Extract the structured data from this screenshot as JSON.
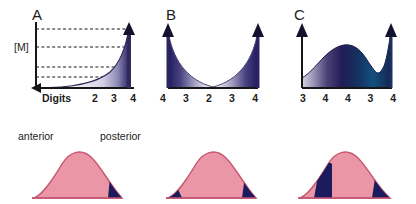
{
  "figure": {
    "panels": [
      {
        "letter": "A",
        "y_axis_label": "[M]",
        "x_axis_prefix": "Digits",
        "ticks": [
          "2",
          "3",
          "4"
        ],
        "curve_shape": "exponential-rise",
        "dashed_guides": 4,
        "arrow_x_direction": "left",
        "arrow_peak": "up",
        "fill_start": "#ffffff",
        "fill_end": "#2b2560"
      },
      {
        "letter": "B",
        "y_axis_label": "",
        "x_axis_prefix": "",
        "ticks": [
          "4",
          "3",
          "2",
          "3",
          "4"
        ],
        "curve_shape": "u-shaped-valley",
        "dashed_guides": 0,
        "arrow_x_direction": "none",
        "arrow_peak": "up-both",
        "fill_start": "#ffffff",
        "fill_end": "#201a5c"
      },
      {
        "letter": "C",
        "y_axis_label": "",
        "x_axis_prefix": "",
        "ticks": [
          "3",
          "4",
          "4",
          "3",
          "4"
        ],
        "curve_shape": "dome-dip-rise",
        "dashed_guides": 0,
        "arrow_x_direction": "none",
        "arrow_peak": "up-both",
        "fill_start": "#d8d4e2",
        "fill_end": "#10255e"
      }
    ],
    "limb_buds": [
      {
        "anterior_label": "anterior",
        "posterior_label": "posterior",
        "domain_pattern": "posterior-wedge-only"
      },
      {
        "anterior_label": "",
        "posterior_label": "",
        "domain_pattern": "both-edge-wedges"
      },
      {
        "anterior_label": "",
        "posterior_label": "",
        "domain_pattern": "wide-left-band-and-right-wedge"
      }
    ],
    "colors": {
      "tissue_pink": "#eb96a6",
      "tissue_outline": "#c4566f",
      "domain_navy": "#1b1b5e",
      "axis_black": "#161616",
      "gradient_dark": "#231d5e",
      "gradient_teal": "#12416e"
    }
  }
}
